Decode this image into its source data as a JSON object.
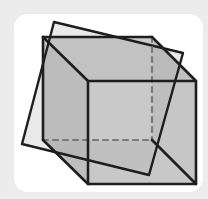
{
  "diagram": {
    "colors": {
      "background": "#ececec",
      "card": "#ffffff",
      "edge": "#1e1e1e",
      "hidden_edge": "#7a7a7a",
      "face_fill": "#b9b9b9",
      "plane_fill": "#a8a8a8"
    },
    "cube": {
      "front_face": [
        [
          88,
          81
        ],
        [
          196,
          81
        ],
        [
          196,
          184
        ],
        [
          88,
          184
        ]
      ],
      "back_face": [
        [
          43,
          37
        ],
        [
          152,
          37
        ],
        [
          152,
          140
        ],
        [
          43,
          140
        ]
      ],
      "visible_edges": [
        [
          [
            43,
            37
          ],
          [
            152,
            37
          ]
        ],
        [
          [
            43,
            37
          ],
          [
            43,
            140
          ]
        ],
        [
          [
            43,
            37
          ],
          [
            88,
            81
          ]
        ],
        [
          [
            152,
            37
          ],
          [
            196,
            81
          ]
        ],
        [
          [
            43,
            140
          ],
          [
            88,
            184
          ]
        ],
        [
          [
            152,
            140
          ],
          [
            196,
            184
          ]
        ]
      ],
      "hidden_edges": [
        [
          [
            152,
            37
          ],
          [
            152,
            140
          ]
        ],
        [
          [
            43,
            140
          ],
          [
            152,
            140
          ]
        ]
      ]
    },
    "plane": {
      "vertices": [
        [
          54,
          22
        ],
        [
          183,
          53
        ],
        [
          149,
          175
        ],
        [
          22,
          144
        ]
      ]
    }
  }
}
